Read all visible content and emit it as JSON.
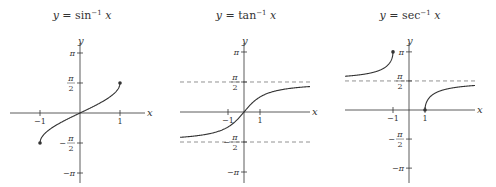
{
  "chart_data": [
    {
      "type": "line",
      "id": "arcsin",
      "title": "y = sin⁻¹ x",
      "title_parts": {
        "lhs": "y",
        "eq": " = ",
        "fn": "sin",
        "exp": "−1",
        "arg": " x"
      },
      "xlabel": "x",
      "ylabel": "y",
      "xlim": [
        -1.8,
        1.8
      ],
      "ylim": [
        -3.3,
        3.3
      ],
      "x_ticks": [
        {
          "value": -1,
          "label": "−1"
        },
        {
          "value": 1,
          "label": "1"
        }
      ],
      "y_ticks": [
        {
          "value": 3.14159,
          "label": "π"
        },
        {
          "value": 1.5708,
          "label": "π/2"
        },
        {
          "value": -1.5708,
          "label": "−π/2"
        },
        {
          "value": -3.14159,
          "label": "−π"
        }
      ],
      "function": "asin",
      "domain": [
        -1,
        1
      ],
      "endpoints": [
        {
          "x": -1,
          "y": -1.5708
        },
        {
          "x": 1,
          "y": 1.5708
        }
      ],
      "asymptotes": []
    },
    {
      "type": "line",
      "id": "arctan",
      "title": "y = tan⁻¹ x",
      "title_parts": {
        "lhs": "y",
        "eq": " = ",
        "fn": "tan",
        "exp": "−1",
        "arg": " x"
      },
      "xlabel": "x",
      "ylabel": "y",
      "xlim": [
        -12,
        12
      ],
      "ylim": [
        -3.3,
        3.3
      ],
      "x_ticks": [
        {
          "value": -1,
          "label": "−1"
        },
        {
          "value": 1,
          "label": "1"
        }
      ],
      "y_ticks": [
        {
          "value": 3.14159,
          "label": "π"
        },
        {
          "value": 1.5708,
          "label": "π/2"
        },
        {
          "value": -1.5708,
          "label": "−π/2"
        },
        {
          "value": -3.14159,
          "label": "−π"
        }
      ],
      "function": "atan",
      "domain": [
        -12,
        12
      ],
      "endpoints": [],
      "asymptotes": [
        1.5708,
        -1.5708
      ]
    },
    {
      "type": "line",
      "id": "arcsec",
      "title": "y = sec⁻¹ x",
      "title_parts": {
        "lhs": "y",
        "eq": " = ",
        "fn": "sec",
        "exp": "−1",
        "arg": " x"
      },
      "xlabel": "x",
      "ylabel": "y",
      "xlim": [
        -12,
        12
      ],
      "ylim": [
        -3.3,
        3.3
      ],
      "x_ticks": [
        {
          "value": -1,
          "label": "−1"
        },
        {
          "value": 1,
          "label": "1"
        }
      ],
      "y_ticks": [
        {
          "value": 3.14159,
          "label": "π"
        },
        {
          "value": 1.5708,
          "label": "π/2"
        },
        {
          "value": -1.5708,
          "label": "−π/2"
        },
        {
          "value": -3.14159,
          "label": "−π"
        }
      ],
      "function": "asec",
      "domain": [
        [
          -12,
          -1
        ],
        [
          1,
          12
        ]
      ],
      "endpoints": [
        {
          "x": -1,
          "y": 3.14159
        },
        {
          "x": 1,
          "y": 0
        }
      ],
      "asymptotes": [
        1.5708
      ]
    }
  ]
}
